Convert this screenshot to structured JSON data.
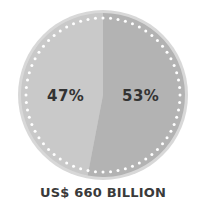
{
  "chart_data": {
    "type": "pie",
    "title": "",
    "categories": [
      "Left segment",
      "Right segment"
    ],
    "values": [
      47,
      53
    ],
    "labels": [
      "47%",
      "53%"
    ],
    "colors": [
      "#c9c9c9",
      "#b3b3b3"
    ],
    "caption": "US$ 660 BILLION",
    "legend": "none"
  },
  "labels": {
    "left": "47%",
    "right": "53%",
    "caption": "US$ 660 BILLION"
  }
}
